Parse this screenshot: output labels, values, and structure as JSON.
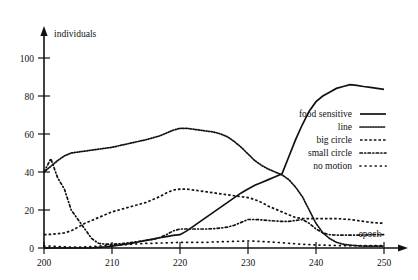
{
  "chart_data": {
    "type": "line",
    "title": "",
    "xlabel": "epoch",
    "ylabel": "individuals",
    "xlim": [
      200,
      250
    ],
    "ylim": [
      0,
      110
    ],
    "xticks": [
      200,
      210,
      220,
      230,
      240,
      250
    ],
    "yticks": [
      0,
      20,
      40,
      60,
      80,
      100
    ],
    "grid": false,
    "legend_position": "right-middle",
    "x": [
      200,
      201,
      202,
      203,
      204,
      205,
      206,
      207,
      208,
      209,
      210,
      211,
      212,
      213,
      214,
      215,
      216,
      217,
      218,
      219,
      220,
      221,
      222,
      223,
      224,
      225,
      226,
      227,
      228,
      229,
      230,
      231,
      232,
      233,
      234,
      235,
      236,
      237,
      238,
      239,
      240,
      241,
      242,
      243,
      244,
      245,
      246,
      247,
      248,
      249,
      250
    ],
    "series": [
      {
        "name": "food sensitive",
        "style": "solid",
        "values": [
          0,
          0,
          0,
          0,
          0,
          0,
          0,
          0,
          0.3,
          0.6,
          1,
          1.5,
          2,
          2.6,
          3.3,
          4,
          4.7,
          5.4,
          6,
          6.6,
          7,
          9,
          11.5,
          14,
          16.5,
          19,
          21.5,
          24,
          26.5,
          29,
          31,
          33,
          34.5,
          36,
          37.5,
          39,
          48,
          57,
          65,
          72,
          77,
          80,
          82,
          84,
          85,
          86,
          85.6,
          85,
          84.5,
          84,
          83.5
        ]
      },
      {
        "name": "line",
        "style": "fine-dotted",
        "values": [
          40,
          43,
          46,
          48.5,
          50,
          50.5,
          51,
          51.5,
          52,
          52.5,
          53,
          53.8,
          54.6,
          55.4,
          56.2,
          57,
          58,
          59,
          60.5,
          62,
          63,
          63,
          62.5,
          62,
          61.5,
          61,
          60,
          58.5,
          56,
          53,
          49.5,
          46,
          43.5,
          41.5,
          40,
          38.5,
          36,
          32,
          27,
          20,
          13,
          8,
          5,
          3,
          2,
          1.5,
          1.2,
          1,
          1,
          1,
          1
        ]
      },
      {
        "name": "big circle",
        "style": "dashed",
        "values": [
          7,
          7.2,
          7.5,
          8,
          9,
          11,
          13,
          14.5,
          16,
          17.5,
          19,
          20,
          21,
          22,
          23,
          24,
          25.5,
          27,
          29,
          30.5,
          31,
          31,
          30.5,
          30,
          29.5,
          29,
          28.5,
          28,
          27.5,
          27,
          26.5,
          25.5,
          24,
          22,
          20.5,
          19,
          17.5,
          16,
          15.5,
          15.5,
          15.5,
          15.5,
          15.5,
          15.5,
          15.2,
          15,
          14.5,
          14,
          13.5,
          13.2,
          13
        ]
      },
      {
        "name": "small circle",
        "style": "dot-dash",
        "values": [
          40,
          47,
          37,
          31,
          20,
          15,
          10,
          5,
          2.5,
          2,
          2,
          2.2,
          2.5,
          3,
          3.5,
          4,
          4.5,
          5.5,
          7,
          9,
          10,
          10,
          10,
          10,
          10,
          10.2,
          10.5,
          11,
          12,
          13.5,
          15,
          15,
          14.8,
          14.5,
          14.2,
          14,
          14,
          14.5,
          15,
          13,
          10,
          8,
          7,
          6.8,
          6.8,
          6.8,
          6.8,
          6.8,
          7,
          7,
          7
        ]
      },
      {
        "name": "no motion",
        "style": "sparse-dotted",
        "values": [
          1,
          1,
          0.8,
          0.6,
          0.5,
          0.5,
          0.6,
          0.8,
          1,
          1.2,
          1.5,
          1.6,
          1.8,
          2,
          2.2,
          2.4,
          2.5,
          2.6,
          2.7,
          2.8,
          3,
          3,
          3,
          3,
          3,
          3.2,
          3.3,
          3.4,
          3.5,
          3.6,
          3.7,
          3.6,
          3.4,
          3.2,
          3,
          2.8,
          2.5,
          2.2,
          2,
          1.8,
          1.6,
          1.5,
          1.4,
          1.3,
          1.2,
          1.2,
          1.2,
          1.2,
          1.2,
          1.2,
          1.2
        ]
      }
    ]
  },
  "axes": {
    "y_title": "individuals",
    "x_title": "epoch",
    "y_tick_labels": [
      "0",
      "20",
      "40",
      "60",
      "80",
      "100"
    ],
    "x_tick_labels": [
      "200",
      "210",
      "220",
      "230",
      "240",
      "250"
    ]
  },
  "legend": {
    "entries": [
      {
        "label": "food sensitive",
        "style": "solid"
      },
      {
        "label": "line",
        "style": "fine-dotted"
      },
      {
        "label": "big circle",
        "style": "dashed"
      },
      {
        "label": "small circle",
        "style": "dot-dash"
      },
      {
        "label": "no motion",
        "style": "sparse-dotted"
      }
    ]
  },
  "colors": {
    "ink": "#111111",
    "background": "#ffffff"
  }
}
